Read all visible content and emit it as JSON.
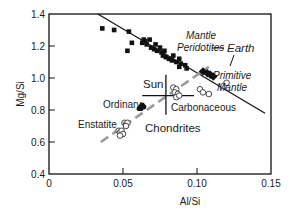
{
  "chart_data": {
    "type": "scatter",
    "title": "",
    "xlabel": "Al/Si",
    "ylabel": "Mg/Si",
    "xlim": [
      0,
      0.15
    ],
    "ylim": [
      0.4,
      1.4
    ],
    "xticks": [
      "0",
      "0.05",
      "0.10",
      "0.15"
    ],
    "yticks": [
      "0.4",
      "0.6",
      "0.8",
      "1.0",
      "1.2",
      "1.4"
    ],
    "grid": false,
    "legend": null,
    "series": [
      {
        "name": "Mantle Peridotites",
        "marker": "filled-square",
        "points": [
          [
            0.036,
            1.31
          ],
          [
            0.044,
            1.3
          ],
          [
            0.054,
            1.29
          ],
          [
            0.053,
            1.17
          ],
          [
            0.056,
            1.22
          ],
          [
            0.063,
            1.22
          ],
          [
            0.064,
            1.24
          ],
          [
            0.065,
            1.23
          ],
          [
            0.068,
            1.24
          ],
          [
            0.066,
            1.21
          ],
          [
            0.069,
            1.19
          ],
          [
            0.071,
            1.18
          ],
          [
            0.073,
            1.17
          ],
          [
            0.072,
            1.21
          ],
          [
            0.075,
            1.19
          ],
          [
            0.076,
            1.16
          ],
          [
            0.077,
            1.14
          ],
          [
            0.078,
            1.17
          ],
          [
            0.079,
            1.13
          ],
          [
            0.081,
            1.12
          ],
          [
            0.083,
            1.11
          ],
          [
            0.084,
            1.14
          ],
          [
            0.086,
            1.1
          ],
          [
            0.088,
            1.12
          ],
          [
            0.089,
            1.09
          ],
          [
            0.092,
            1.08
          ],
          [
            0.093,
            1.06
          ],
          [
            0.088,
            1.07
          ]
        ]
      },
      {
        "name": "Primitive Mantle (Earth)",
        "marker": "filled-diamond",
        "points": [
          [
            0.104,
            1.04
          ],
          [
            0.107,
            1.03
          ],
          [
            0.109,
            1.02
          ],
          [
            0.111,
            1.01
          ]
        ]
      },
      {
        "name": "Ordinary Chondrites",
        "marker": "filled-circle",
        "points": [
          [
            0.062,
            0.82
          ],
          [
            0.063,
            0.83
          ],
          [
            0.064,
            0.82
          ],
          [
            0.061,
            0.81
          ],
          [
            0.062,
            0.81
          ]
        ]
      },
      {
        "name": "Enstatite Chondrites",
        "marker": "open-circle",
        "points": [
          [
            0.051,
            0.72
          ],
          [
            0.052,
            0.71
          ],
          [
            0.053,
            0.72
          ],
          [
            0.052,
            0.7
          ],
          [
            0.047,
            0.67
          ],
          [
            0.048,
            0.66
          ],
          [
            0.049,
            0.67
          ],
          [
            0.05,
            0.65
          ],
          [
            0.048,
            0.64
          ]
        ]
      },
      {
        "name": "Carbonaceous Chondrites",
        "marker": "open-circle",
        "points": [
          [
            0.084,
            0.94
          ],
          [
            0.086,
            0.93
          ],
          [
            0.085,
            0.91
          ],
          [
            0.087,
            0.9
          ],
          [
            0.086,
            0.88
          ],
          [
            0.088,
            0.89
          ],
          [
            0.102,
            0.93
          ],
          [
            0.104,
            0.91
          ],
          [
            0.108,
            0.9
          ],
          [
            0.118,
            0.95
          ],
          [
            0.12,
            0.97
          ]
        ]
      }
    ],
    "lines": [
      {
        "name": "Mantle trend",
        "style": "solid",
        "from": [
          0.033,
          1.4
        ],
        "to": [
          0.146,
          0.78
        ]
      },
      {
        "name": "Chondrite trend",
        "style": "dashed-gray",
        "from": [
          0.035,
          0.6
        ],
        "to": [
          0.108,
          1.07
        ]
      }
    ],
    "sun": {
      "x": 0.079,
      "y": 0.89,
      "hx": [
        0.063,
        0.098
      ],
      "vy": [
        0.77,
        1.02
      ]
    },
    "annotations": [
      {
        "text": "Mantle",
        "style": "italic"
      },
      {
        "text": "Peridotites",
        "style": "italic"
      },
      {
        "text": "Earth",
        "style": "italic"
      },
      {
        "text": "Primitive",
        "style": "italic"
      },
      {
        "text": "Mantle",
        "style": "italic"
      },
      {
        "text": "Sun",
        "style": "normal"
      },
      {
        "text": "Carbonaceous",
        "style": "normal"
      },
      {
        "text": "Ordinary",
        "style": "normal"
      },
      {
        "text": "Enstatite",
        "style": "normal"
      },
      {
        "text": "Chondrites",
        "style": "normal"
      }
    ]
  },
  "colors": {
    "ink": "#111111",
    "dashed": "#9a9a9a"
  }
}
